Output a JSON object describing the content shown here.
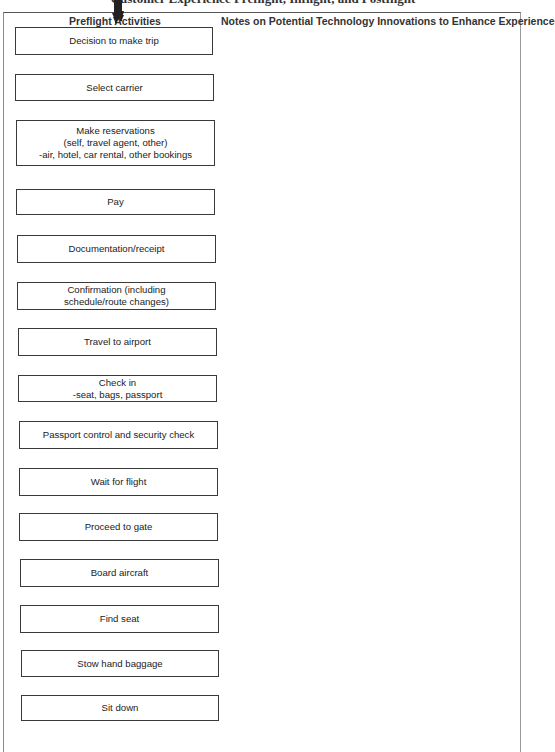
{
  "title": "Customer Experience Preflight, Inflight, and Postflight",
  "columns": {
    "left_header": "Preflight Activities",
    "right_header": "Notes on Potential Technology Innovations to Enhance Experience"
  },
  "steps": [
    {
      "label": "Decision to make trip",
      "x": 15,
      "y": 27,
      "w": 198,
      "h": 28
    },
    {
      "label": "Select carrier",
      "x": 15,
      "y": 74,
      "w": 199,
      "h": 27
    },
    {
      "label": "Make reservations\n(self, travel agent, other)\n-air, hotel, car rental, other bookings",
      "x": 16,
      "y": 120,
      "w": 199,
      "h": 46
    },
    {
      "label": "Pay",
      "x": 16,
      "y": 189,
      "w": 199,
      "h": 26
    },
    {
      "label": "Documentation/receipt",
      "x": 17,
      "y": 235,
      "w": 199,
      "h": 28
    },
    {
      "label": "Confirmation (including\nschedule/route changes)",
      "x": 17,
      "y": 282,
      "w": 199,
      "h": 28
    },
    {
      "label": "Travel to airport",
      "x": 18,
      "y": 328,
      "w": 199,
      "h": 28
    },
    {
      "label": "Check in\n-seat, bags, passport",
      "x": 18,
      "y": 375,
      "w": 199,
      "h": 27
    },
    {
      "label": "Passport control and security check",
      "x": 19,
      "y": 421,
      "w": 199,
      "h": 28
    },
    {
      "label": "Wait for flight",
      "x": 19,
      "y": 468,
      "w": 199,
      "h": 28
    },
    {
      "label": "Proceed to gate",
      "x": 19,
      "y": 513,
      "w": 199,
      "h": 28
    },
    {
      "label": "Board aircraft",
      "x": 20,
      "y": 559,
      "w": 199,
      "h": 28
    },
    {
      "label": "Find seat",
      "x": 20,
      "y": 605,
      "w": 199,
      "h": 28
    },
    {
      "label": "Stow hand baggage",
      "x": 21,
      "y": 650,
      "w": 198,
      "h": 27
    },
    {
      "label": "Sit down",
      "x": 21,
      "y": 695,
      "w": 198,
      "h": 26
    }
  ],
  "arrows": [
    {
      "x": 114,
      "y1": 55,
      "y2": 74
    },
    {
      "x": 115,
      "y1": 101,
      "y2": 120
    },
    {
      "x": 115,
      "y1": 166,
      "y2": 189
    },
    {
      "x": 116,
      "y1": 215,
      "y2": 235
    },
    {
      "x": 116,
      "y1": 263,
      "y2": 282
    },
    {
      "x": 117,
      "y1": 310,
      "y2": 328
    },
    {
      "x": 117,
      "y1": 356,
      "y2": 375
    },
    {
      "x": 118,
      "y1": 402,
      "y2": 421
    },
    {
      "x": 118,
      "y1": 449,
      "y2": 468
    },
    {
      "x": 118,
      "y1": 496,
      "y2": 513
    },
    {
      "x": 119,
      "y1": 541,
      "y2": 559
    },
    {
      "x": 119,
      "y1": 587,
      "y2": 605
    },
    {
      "x": 120,
      "y1": 633,
      "y2": 650
    },
    {
      "x": 120,
      "y1": 677,
      "y2": 695
    },
    {
      "x": 120,
      "y1": 721,
      "y2": 742
    }
  ]
}
